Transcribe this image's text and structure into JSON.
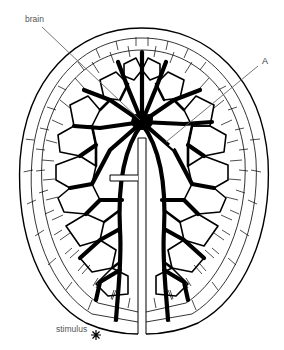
{
  "diagram": {
    "type": "nerve-net illustration",
    "labels": {
      "brain": "brain",
      "a": "A",
      "stimulus": "stimulus"
    },
    "icons": {
      "stimulus_marker": "asterisk-burst"
    },
    "colors": {
      "ink": "#000000",
      "background": "#ffffff",
      "label_text": "#555555",
      "leader_line": "#666666"
    }
  }
}
